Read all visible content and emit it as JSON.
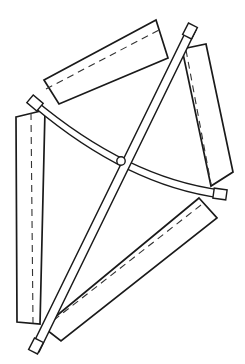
{
  "figure": {
    "width": 245,
    "height": 364,
    "background_color": "#ffffff",
    "stroke_color": "#1a1a1a",
    "dashed_stroke_color": "#333333",
    "panel_fill": "#ffffff",
    "style": "technical line drawing, black ink on white, no text labels",
    "stroke_width_outline": 1.7,
    "stroke_width_bar": 1.5,
    "stroke_width_dashed": 1.1,
    "dash_pattern": "7 5"
  },
  "panels": [
    {
      "name": "top-panel",
      "label": "upper-left plate",
      "points": "44,80 156,20 168,58 59,104",
      "dashed_diagonal": "46,89 159,30"
    },
    {
      "name": "right-panel",
      "label": "upper-right plate",
      "points": "182,49 206,44 233,172 211,186",
      "dashed_diagonal": "186,50 211,184"
    },
    {
      "name": "left-panel",
      "label": "lower-left plate",
      "points": "16,117 45,110 40,324 17,322",
      "dashed_diagonal": "31,113 33,323"
    },
    {
      "name": "bottom-panel",
      "label": "lower-right plate",
      "points": "199,198 217,218 61,341 43,327",
      "dashed_diagonal": "201,205 45,327"
    }
  ],
  "bars": [
    {
      "name": "straight-bar",
      "label": "straight crossing bar",
      "kind": "straight",
      "edge_a": "189,25 31,348",
      "edge_b": "196,30 39,352",
      "end_top": {
        "cx": 190,
        "cy": 31,
        "angle": -63
      },
      "end_bottom": {
        "cx": 36,
        "cy": 346,
        "angle": -63
      }
    },
    {
      "name": "curved-bar",
      "label": "curved crossing bar",
      "kind": "curved",
      "edge_a": "M 34,99 Q 128,178 221,190",
      "edge_b": "M 34,107 Q 128,186 221,198",
      "end_left": {
        "cx": 35,
        "cy": 103,
        "angle": 40
      },
      "end_right": {
        "cx": 220,
        "cy": 194,
        "angle": 8
      }
    }
  ],
  "pivot": {
    "name": "center-pivot",
    "label": "central pivot joint",
    "cx": 121,
    "cy": 161,
    "r": 4.2
  },
  "hatch_caps": [
    {
      "name": "cap-top-right",
      "cx": 190,
      "cy": 31,
      "angle": -63,
      "w": 13,
      "h": 10
    },
    {
      "name": "cap-bottom-left",
      "cx": 36,
      "cy": 346,
      "angle": -63,
      "w": 13,
      "h": 10
    },
    {
      "name": "cap-left",
      "cx": 35,
      "cy": 103,
      "angle": 40,
      "w": 13,
      "h": 10
    },
    {
      "name": "cap-right",
      "cx": 220,
      "cy": 194,
      "angle": 8,
      "w": 13,
      "h": 10
    }
  ]
}
